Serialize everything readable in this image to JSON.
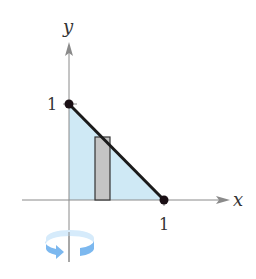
{
  "figure": {
    "axes": {
      "x_label": "x",
      "y_label": "y",
      "x_tick": "1",
      "y_tick": "1"
    },
    "points": [
      {
        "name": "(0, 1)",
        "x": 0,
        "y": 1
      },
      {
        "name": "(1, 0)",
        "x": 1,
        "y": 0
      }
    ],
    "line": {
      "equation": "y = 1 - x",
      "from": [
        0,
        1
      ],
      "to": [
        1,
        0
      ]
    },
    "region": {
      "vertices": [
        [
          0,
          0
        ],
        [
          0,
          1
        ],
        [
          1,
          0
        ]
      ],
      "fill": "#cfe9f5"
    },
    "rectangle": {
      "x_start": 0.27,
      "x_end": 0.43,
      "height": 0.65,
      "fill": "#c4c4c4"
    },
    "rotation_axis": "y-axis",
    "rotation_icon_color": "#7cb8ef"
  }
}
